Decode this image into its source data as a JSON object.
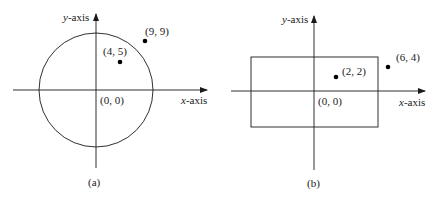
{
  "panels": [
    {
      "caption": "(a)",
      "shape": "circle",
      "x_axis_label_var": "x",
      "x_axis_label_suffix": "-axis",
      "y_axis_label_var": "y",
      "y_axis_label_suffix": "-axis",
      "origin_label": "(0, 0)",
      "points": [
        {
          "label": "(4, 5)",
          "inside": true
        },
        {
          "label": "(9, 9)",
          "inside": false
        }
      ]
    },
    {
      "caption": "(b)",
      "shape": "rectangle",
      "x_axis_label_var": "x",
      "x_axis_label_suffix": "-axis",
      "y_axis_label_var": "y",
      "y_axis_label_suffix": "-axis",
      "origin_label": "(0, 0)",
      "points": [
        {
          "label": "(2, 2)",
          "inside": true
        },
        {
          "label": "(6, 4)",
          "inside": false
        }
      ]
    }
  ],
  "colors": {
    "ink": "#1a1a1a",
    "background": "#ffffff"
  }
}
